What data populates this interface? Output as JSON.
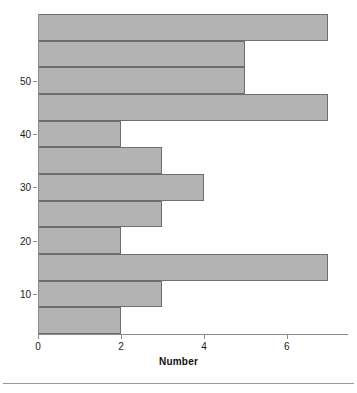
{
  "chart_data": {
    "type": "bar",
    "orientation": "horizontal",
    "title": "",
    "subtitle": "",
    "xlabel": "Number",
    "ylabel": "",
    "xlim": [
      0,
      7.04
    ],
    "ylim": [
      2.5,
      62.5
    ],
    "grid": false,
    "legend": null,
    "x_ticks": [
      0,
      2,
      4,
      6
    ],
    "x_tick_labels": [
      "0",
      "2",
      "4",
      "6"
    ],
    "y_ticks": [
      10,
      20,
      30,
      40,
      50
    ],
    "y_tick_labels": [
      "10",
      "20",
      "30",
      "40",
      "50"
    ],
    "bin_width": 5,
    "categories": [
      "2.5-7.5",
      "7.5-12.5",
      "12.5-17.5",
      "17.5-22.5",
      "22.5-27.5",
      "27.5-32.5",
      "32.5-37.5",
      "37.5-42.5",
      "42.5-47.5",
      "47.5-52.5",
      "52.5-57.5",
      "57.5-62.5"
    ],
    "bars": [
      {
        "bin_start": 57.5,
        "bin_end": 62.5,
        "value": 7
      },
      {
        "bin_start": 52.5,
        "bin_end": 57.5,
        "value": 5
      },
      {
        "bin_start": 47.5,
        "bin_end": 52.5,
        "value": 5
      },
      {
        "bin_start": 42.5,
        "bin_end": 47.5,
        "value": 7
      },
      {
        "bin_start": 37.5,
        "bin_end": 42.5,
        "value": 2
      },
      {
        "bin_start": 32.5,
        "bin_end": 37.5,
        "value": 3
      },
      {
        "bin_start": 27.5,
        "bin_end": 32.5,
        "value": 4
      },
      {
        "bin_start": 22.5,
        "bin_end": 27.5,
        "value": 3
      },
      {
        "bin_start": 17.5,
        "bin_end": 22.5,
        "value": 2
      },
      {
        "bin_start": 12.5,
        "bin_end": 17.5,
        "value": 7
      },
      {
        "bin_start": 7.5,
        "bin_end": 12.5,
        "value": 3
      },
      {
        "bin_start": 2.5,
        "bin_end": 7.5,
        "value": 2
      }
    ],
    "values": [
      7,
      5,
      5,
      7,
      2,
      3,
      4,
      3,
      2,
      7,
      3,
      2
    ],
    "colors": {
      "bar_fill": "#b3b3b3",
      "bar_edge": "#6e6e6e",
      "axis": "#8a8a8a",
      "text": "#1a1a1a",
      "background": "#ffffff",
      "footer_rule": "#9a9a9a"
    }
  }
}
